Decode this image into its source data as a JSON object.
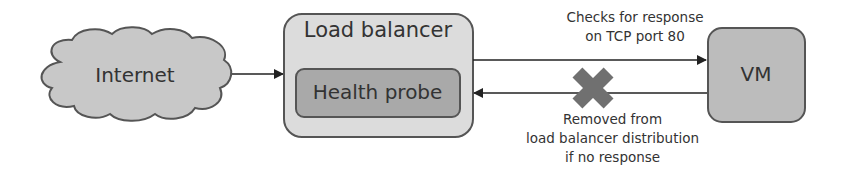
{
  "diagram": {
    "internet": {
      "label": "Internet"
    },
    "load_balancer": {
      "label": "Load balancer",
      "health_probe": {
        "label": "Health probe"
      }
    },
    "vm": {
      "label": "VM"
    },
    "edges": {
      "probe_to_vm": {
        "label_line1": "Checks for response",
        "label_line2": "on TCP port 80"
      },
      "vm_to_probe": {
        "label_line1": "Removed from",
        "label_line2": "load balancer distribution",
        "label_line3": "if no response",
        "status": "failed"
      }
    },
    "colors": {
      "cloud": "#c8c8c8",
      "lb": "#dcdcdc",
      "probe": "#a9a9a9",
      "vm": "#bcbcbc",
      "stroke": "#555555",
      "cross": "#707070"
    }
  }
}
